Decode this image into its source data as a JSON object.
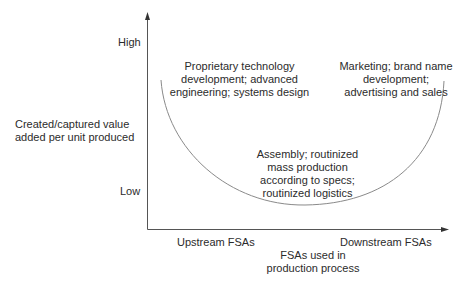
{
  "diagram": {
    "type": "smile-curve",
    "y_axis": {
      "title": "Created/captured value\nadded per unit produced",
      "high_label": "High",
      "low_label": "Low"
    },
    "x_axis": {
      "title": "FSAs used in\nproduction process",
      "left_label": "Upstream FSAs",
      "right_label": "Downstream FSAs"
    },
    "regions": {
      "upstream": "Proprietary technology\ndevelopment; advanced\nengineering; systems design",
      "midstream": "Assembly; routinized\nmass production\naccording to specs;\nroutinized logistics",
      "downstream": "Marketing; brand name\ndevelopment;\nadvertising and sales"
    },
    "colors": {
      "axis": "#555555",
      "curve": "#8a8a8a",
      "text": "#2b2b2b"
    }
  }
}
